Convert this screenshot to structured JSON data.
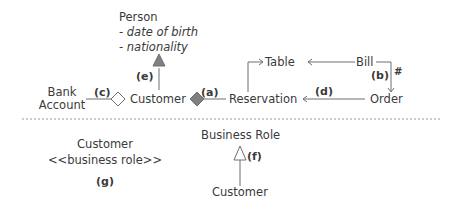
{
  "diagram": {
    "upper": {
      "person": {
        "title": "Person",
        "attributes": [
          "- date of birth",
          "- nationality"
        ]
      },
      "nodes": {
        "bank_account_line1": "Bank",
        "bank_account_line2": "Account",
        "customer": "Customer",
        "reservation": "Reservation",
        "table": "Table",
        "bill": "Bill",
        "order": "Order"
      },
      "markers": {
        "a": "(a)",
        "b": "(b)",
        "b_symbol": "#",
        "c": "(c)",
        "d": "(d)",
        "e": "(e)"
      }
    },
    "lower": {
      "g_block": {
        "line1": "Customer",
        "line2": "<<business role>>",
        "marker": "(g)"
      },
      "f_block": {
        "parent": "Business Role",
        "child": "Customer",
        "marker": "(f)"
      }
    },
    "colors": {
      "line": "#6f6f6f",
      "filled_shape": "#808080",
      "text": "#3a3a3a",
      "divider": "#9a9a9a"
    }
  }
}
